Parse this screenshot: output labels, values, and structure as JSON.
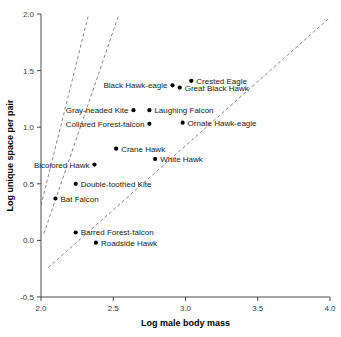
{
  "chart_data": {
    "type": "scatter",
    "title": "",
    "xlabel": "Log male body mass",
    "ylabel": "Log unique space per pair",
    "xlim": [
      2.0,
      4.0
    ],
    "ylim": [
      -0.5,
      2.0
    ],
    "xticks": [
      "2.0",
      "2.5",
      "3.0",
      "3.5",
      "4.0"
    ],
    "xtick_values": [
      2.0,
      2.5,
      3.0,
      3.5,
      4.0
    ],
    "yticks": [
      "-0.5",
      "0.0",
      "0.5",
      "1.0",
      "1.5",
      "2.0"
    ],
    "ytick_values": [
      -0.5,
      0.0,
      0.5,
      1.0,
      1.5,
      2.0
    ],
    "grid": false,
    "legend": "none",
    "points": [
      {
        "label": "Crested Eagle",
        "x": 3.04,
        "y": 1.41,
        "label_side": "right"
      },
      {
        "label": "Great Black Hawk",
        "x": 2.96,
        "y": 1.35,
        "label_side": "right"
      },
      {
        "label": "Black Hawk-eagle",
        "x": 2.91,
        "y": 1.37,
        "label_side": "left"
      },
      {
        "label": "Laughing Falcon",
        "x": 2.75,
        "y": 1.15,
        "label_side": "right"
      },
      {
        "label": "Gray-headed Kite",
        "x": 2.64,
        "y": 1.15,
        "label_side": "left"
      },
      {
        "label": "Ornate Hawk-eagle",
        "x": 2.98,
        "y": 1.04,
        "label_side": "right"
      },
      {
        "label": "Collared Forest-falcon",
        "x": 2.75,
        "y": 1.03,
        "label_side": "left"
      },
      {
        "label": "Crane Hawk",
        "x": 2.52,
        "y": 0.81,
        "label_side": "right"
      },
      {
        "label": "White Hawk",
        "x": 2.79,
        "y": 0.72,
        "label_side": "right"
      },
      {
        "label": "Bicolored Hawk",
        "x": 2.37,
        "y": 0.67,
        "label_side": "left"
      },
      {
        "label": "Double-toothed Kite",
        "x": 2.24,
        "y": 0.5,
        "label_side": "right"
      },
      {
        "label": "Bat Falcon",
        "x": 2.1,
        "y": 0.37,
        "label_side": "right"
      },
      {
        "label": "Barred Forest-falcon",
        "x": 2.24,
        "y": 0.07,
        "label_side": "right"
      },
      {
        "label": "Roadside Hawk",
        "x": 2.38,
        "y": -0.02,
        "label_side": "right"
      }
    ],
    "fit_lines": [
      {
        "name": "upper-line",
        "x0": 2.0,
        "y0": 0.31,
        "x1": 2.33,
        "y1": 2.0
      },
      {
        "name": "middle-line",
        "x0": 2.02,
        "y0": 0.06,
        "x1": 2.54,
        "y1": 2.0
      },
      {
        "name": "lower-line",
        "x0": 2.05,
        "y0": -0.24,
        "x1": 4.0,
        "y1": 1.97
      }
    ]
  }
}
